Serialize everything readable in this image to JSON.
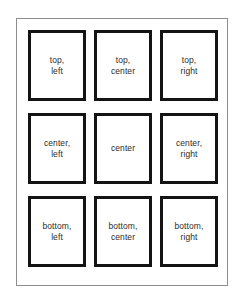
{
  "figure": {
    "name": "alignment-position-grid",
    "background_color": "#ffffff",
    "outer_frame_color": "#8d8d8d",
    "cell_border_color": "#141414",
    "text_color": "#2b2b2b",
    "rows": 3,
    "columns": 3
  },
  "cells": [
    {
      "id": "top-left",
      "line1": "top,",
      "line2": "left"
    },
    {
      "id": "top-center",
      "line1": "top,",
      "line2": "center"
    },
    {
      "id": "top-right",
      "line1": "top,",
      "line2": "right"
    },
    {
      "id": "center-left",
      "line1": "center,",
      "line2": "left"
    },
    {
      "id": "center",
      "line1": "center",
      "line2": ""
    },
    {
      "id": "center-right",
      "line1": "center,",
      "line2": "right"
    },
    {
      "id": "bottom-left",
      "line1": "bottom,",
      "line2": "left"
    },
    {
      "id": "bottom-center",
      "line1": "bottom,",
      "line2": "center"
    },
    {
      "id": "bottom-right",
      "line1": "bottom,",
      "line2": "right"
    }
  ]
}
